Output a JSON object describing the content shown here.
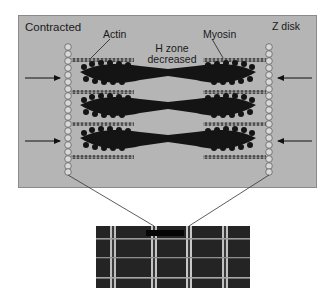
{
  "diagram": {
    "title": "Contracted",
    "labels": {
      "actin": "Actin",
      "myosin": "Myosin",
      "z_disk": "Z disk",
      "h_zone_line1": "H zone",
      "h_zone_line2": "decreased"
    },
    "state": "contracted",
    "arrows": [
      {
        "side": "left",
        "direction": "inward",
        "y": 78
      },
      {
        "side": "left",
        "direction": "inward",
        "y": 141
      },
      {
        "side": "right",
        "direction": "inward",
        "y": 78
      },
      {
        "side": "right",
        "direction": "inward",
        "y": 141
      }
    ],
    "filaments": {
      "actin_rows": 4,
      "myosin_bundles": 3
    },
    "colors": {
      "panel": "#b5b5b5",
      "filament": "#141414",
      "actin": "#6e6e6e",
      "background": "#ffffff"
    },
    "micrograph": {
      "description": "electron micrograph of contracted sarcomere"
    }
  }
}
